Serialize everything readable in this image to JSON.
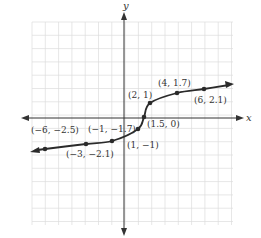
{
  "chart_data": {
    "type": "line",
    "title": "",
    "xlabel": "x",
    "ylabel": "y",
    "grid": true,
    "xlim": [
      -7,
      8
    ],
    "ylim": [
      -8,
      8
    ],
    "points": [
      {
        "x": -6,
        "y": -2.5,
        "label": "(−6, −2.5)"
      },
      {
        "x": -3,
        "y": -2.1,
        "label": "(−3, −2.1)"
      },
      {
        "x": -1,
        "y": -1.7,
        "label": "(−1, −1.7)"
      },
      {
        "x": 1,
        "y": -1,
        "label": "(1, −1)"
      },
      {
        "x": 1.5,
        "y": 0,
        "label": "(1.5, 0)"
      },
      {
        "x": 2,
        "y": 1,
        "label": "(2, 1)"
      },
      {
        "x": 4,
        "y": 1.7,
        "label": "(4, 1.7)"
      },
      {
        "x": 6,
        "y": 2.1,
        "label": "(6, 2.1)"
      }
    ],
    "arrows": {
      "left_end": true,
      "right_end": true
    }
  },
  "axes": {
    "x_label": "x",
    "y_label": "y"
  }
}
